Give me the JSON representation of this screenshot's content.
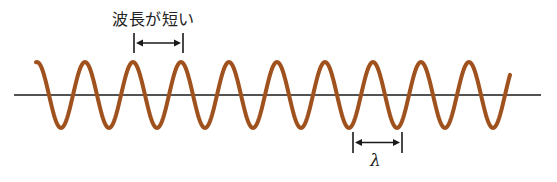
{
  "diagram": {
    "title_label": "波長が短い",
    "lambda_label": "λ",
    "colors": {
      "wave": "#a0521e",
      "axis": "#1a1a1a",
      "markers": "#1a1a1a"
    },
    "wave": {
      "start_x": 36,
      "end_x": 510,
      "axis_y": 95,
      "amplitude": 33,
      "period_px": 48,
      "first_peak_x": 85
    },
    "axis": {
      "x1": 14,
      "x2": 541,
      "y": 95
    },
    "wavelength_marker_top": {
      "x1": 134,
      "x2": 183,
      "y_top": 33,
      "y_bottom": 53
    },
    "wavelength_marker_bottom": {
      "x1": 353,
      "x2": 402,
      "y_top": 132,
      "y_bottom": 153
    }
  }
}
